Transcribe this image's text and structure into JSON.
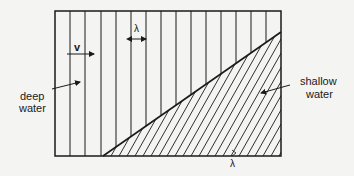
{
  "diagram": {
    "type": "wavefront refraction at depth boundary",
    "labels": {
      "velocity": "v",
      "wavelength_top": "λ",
      "wavelength_bottom": "λ",
      "deep_line1": "deep",
      "deep_line2": "water",
      "shallow_line1": "shallow",
      "shallow_line2": "water"
    },
    "regions": [
      {
        "name": "deep water",
        "wavefronts": "vertical parallel lines"
      },
      {
        "name": "shallow water",
        "wavefronts": "slanted closer-spaced lines"
      }
    ],
    "colors": {
      "background": "#f4f4f2",
      "lines": "#1a1a1a"
    }
  }
}
